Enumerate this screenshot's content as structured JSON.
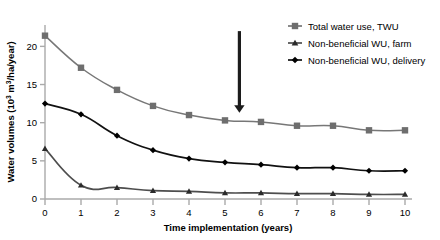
{
  "chart_data": {
    "type": "line",
    "title": "",
    "xlabel": "Time implementation (years)",
    "ylabel_parts": {
      "main": "Water volumes (10",
      "exponent": "3",
      "mid": " m",
      "exponent2": "3",
      "tail": "/ha/year)"
    },
    "ylabel": "Water volumes (10³ m³/ha/year)",
    "x": [
      0,
      1,
      2,
      3,
      4,
      5,
      6,
      7,
      8,
      9,
      10
    ],
    "xticklabels": [
      "0",
      "1",
      "2",
      "3",
      "4",
      "5",
      "6",
      "7",
      "8",
      "9",
      "10"
    ],
    "yticks": [
      0,
      5,
      10,
      15,
      20
    ],
    "yticklabels": [
      "0",
      "5",
      "10",
      "15",
      "20"
    ],
    "xlim": [
      0,
      10
    ],
    "ylim": [
      0,
      22.8
    ],
    "grid": false,
    "legend_position": "upper-right",
    "series": [
      {
        "name": "Total water use, TWU",
        "marker": "square",
        "color": "#777777",
        "marker_color": "#6e6e6e",
        "values": [
          21.4,
          17.2,
          14.3,
          12.2,
          11.0,
          10.3,
          10.1,
          9.6,
          9.6,
          9.0,
          9.0
        ]
      },
      {
        "name": "Non-beneficial WU, farm",
        "marker": "triangle",
        "color": "#4d4d4d",
        "marker_color": "#2b2b2b",
        "values": [
          6.6,
          1.8,
          1.5,
          1.1,
          1.0,
          0.8,
          0.8,
          0.7,
          0.7,
          0.6,
          0.6
        ]
      },
      {
        "name": "Non-beneficial WU, delivery",
        "marker": "diamond",
        "color": "#111111",
        "marker_color": "#000000",
        "values": [
          12.5,
          11.1,
          8.3,
          6.4,
          5.3,
          4.8,
          4.5,
          4.1,
          4.1,
          3.7,
          3.7
        ]
      }
    ],
    "annotations": [
      {
        "type": "arrow",
        "name": "downward-arrow",
        "direction": "down",
        "x": 5.4,
        "y_top": 22.0,
        "y_bottom": 11.3,
        "color": "#1c1c1c"
      }
    ]
  }
}
